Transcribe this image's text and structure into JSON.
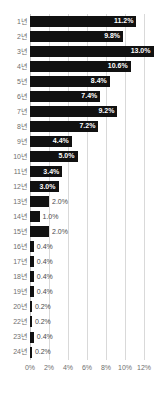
{
  "chart_data": {
    "type": "bar",
    "orientation": "horizontal",
    "title": "",
    "subtitle": "",
    "xlabel": "",
    "ylabel": "",
    "xlim": [
      0,
      12
    ],
    "grid": true,
    "legend": null,
    "xtick_labels": [
      "0%",
      "2%",
      "4%",
      "6%",
      "8%",
      "10%",
      "12%"
    ],
    "xtick_values": [
      0,
      2,
      4,
      6,
      8,
      10,
      12
    ],
    "value_suffix": "%",
    "categories": [
      "1년",
      "2년",
      "3년",
      "4년",
      "5년",
      "6년",
      "7년",
      "8년",
      "9년",
      "10년",
      "11년",
      "12년",
      "13년",
      "14년",
      "15년",
      "16년",
      "17년",
      "18년",
      "19년",
      "20년",
      "22년",
      "23년",
      "24년"
    ],
    "values": [
      11.2,
      9.8,
      13.0,
      10.6,
      8.4,
      7.4,
      9.2,
      7.2,
      4.4,
      5.0,
      3.4,
      3.0,
      2.0,
      1.0,
      2.0,
      0.4,
      0.4,
      0.4,
      0.4,
      0.2,
      0.2,
      0.4,
      0.2
    ],
    "value_labels": [
      "11.2%",
      "9.8%",
      "13.0%",
      "10.6%",
      "8.4%",
      "7.4%",
      "9.2%",
      "7.2%",
      "4.4%",
      "5.0%",
      "3.4%",
      "3.0%",
      "2.0%",
      "1.0%",
      "2.0%",
      "0.4%",
      "0.4%",
      "0.4%",
      "0.4%",
      "0.2%",
      "0.2%",
      "0.4%",
      "0.2%"
    ],
    "label_placement": [
      "inside",
      "inside",
      "inside",
      "inside",
      "inside",
      "inside",
      "inside",
      "inside",
      "inside",
      "inside",
      "inside",
      "inside",
      "outside",
      "outside",
      "outside",
      "outside",
      "outside",
      "outside",
      "outside",
      "outside",
      "outside",
      "outside",
      "outside"
    ],
    "colors": {
      "bar": "#111111",
      "grid": "#d9d9d9",
      "axis": "#c2c2c2",
      "label_inside": "#ffffff",
      "label_outside": "#4a4a4a",
      "tick_text": "#6f6f6f",
      "background": "#ffffff"
    }
  }
}
